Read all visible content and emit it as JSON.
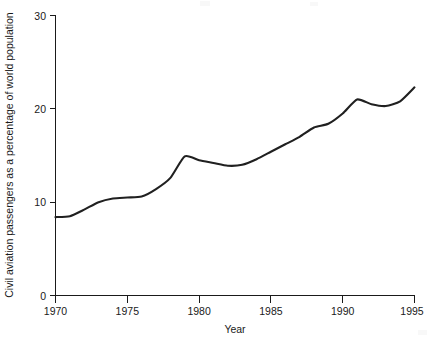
{
  "chart_data": {
    "type": "line",
    "title": "",
    "xlabel": "Year",
    "ylabel": "Civil aviation passengers as a percentage of world population",
    "xlim": [
      1970,
      1995
    ],
    "ylim": [
      0,
      30
    ],
    "xticks": [
      1970,
      1975,
      1980,
      1985,
      1990,
      1995
    ],
    "yticks": [
      0,
      10,
      20,
      30
    ],
    "xtick_labels": [
      "1970",
      "1975",
      "1980",
      "1985",
      "1990",
      "1995"
    ],
    "ytick_labels": [
      "0",
      "10",
      "20",
      "30"
    ],
    "grid": false,
    "legend": false,
    "series": [
      {
        "name": "Civil aviation passengers as a percentage of world population",
        "color": "#202020",
        "x": [
          1970,
          1971,
          1972,
          1973,
          1974,
          1975,
          1976,
          1977,
          1978,
          1979,
          1980,
          1981,
          1982,
          1983,
          1984,
          1985,
          1986,
          1987,
          1988,
          1989,
          1990,
          1991,
          1992,
          1993,
          1994,
          1995
        ],
        "values": [
          8.4,
          8.5,
          9.2,
          10.0,
          10.4,
          10.5,
          10.6,
          11.4,
          12.6,
          14.9,
          14.5,
          14.2,
          13.9,
          14.0,
          14.6,
          15.4,
          16.2,
          17.0,
          18.0,
          18.4,
          19.5,
          21.0,
          20.5,
          20.3,
          20.8,
          22.3
        ]
      }
    ]
  }
}
